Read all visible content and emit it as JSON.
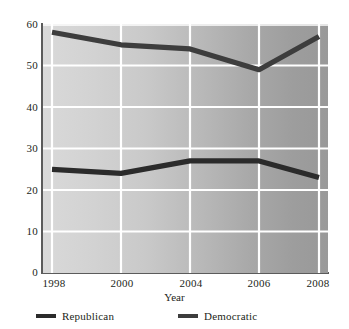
{
  "chart_data": {
    "type": "line",
    "title": "",
    "subtitle": "",
    "xlabel": "Year",
    "ylabel": "",
    "categories": [
      "1998",
      "2000",
      "2004",
      "2006",
      "2008"
    ],
    "x": [
      1998,
      2000,
      2004,
      2006,
      2008
    ],
    "xlim": [
      1998,
      2008
    ],
    "ylim": [
      0,
      60
    ],
    "yticks": [
      0,
      10,
      20,
      30,
      40,
      50,
      60
    ],
    "xticks": [
      "1998",
      "2000",
      "2004",
      "2006",
      "2008"
    ],
    "grid": true,
    "legend_position": "bottom",
    "series": [
      {
        "name": "Republican",
        "color": "#2b2b2b",
        "values": [
          25,
          24,
          27,
          27,
          23
        ]
      },
      {
        "name": "Democratic",
        "color": "#3d3d3d",
        "values": [
          58,
          55,
          54,
          49,
          57
        ]
      }
    ]
  },
  "axes": {
    "y_tick_labels": [
      "60",
      "50",
      "40",
      "30",
      "20",
      "10",
      "0"
    ],
    "x_tick_labels": [
      "1998",
      "2000",
      "2004",
      "2006",
      "2008"
    ],
    "x_title": "Year"
  },
  "legend": {
    "items": [
      {
        "label": "Republican",
        "color": "#2b2b2b"
      },
      {
        "label": "Democratic",
        "color": "#3d3d3d"
      }
    ]
  },
  "colors": {
    "republican": "#2b2b2b",
    "democratic": "#3d3d3d",
    "gridline": "#ffffff",
    "axis": "#5b5b5b",
    "text": "#231f20",
    "plot_bg_left": "#d9d9d9",
    "plot_bg_right": "#999999"
  }
}
